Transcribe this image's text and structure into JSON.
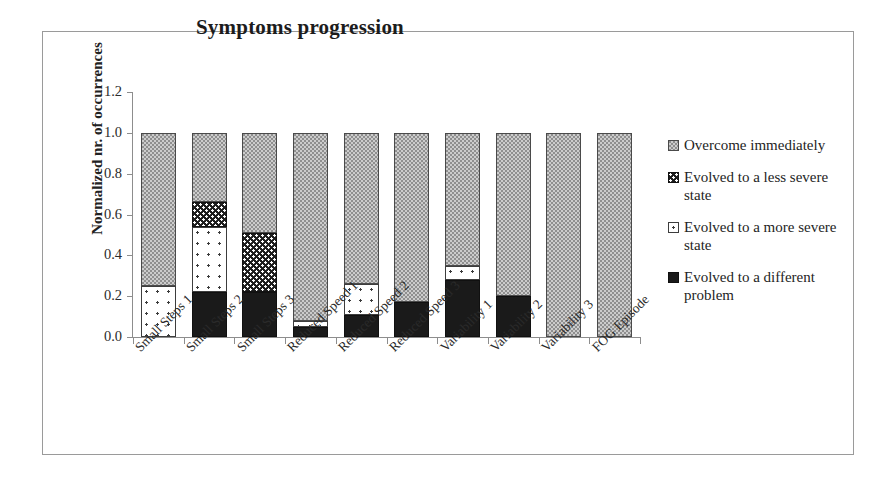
{
  "figure": {
    "title": "Symptoms progression"
  },
  "chart_data": {
    "type": "bar",
    "subtype": "stacked-normalized",
    "title": "Symptoms progression",
    "xlabel": "",
    "ylabel": "Normalized nr. of occurrences",
    "ylim": [
      0.0,
      1.2
    ],
    "yticks": [
      "0.0",
      "0.2",
      "0.4",
      "0.6",
      "0.8",
      "1.0",
      "1.2"
    ],
    "ytick_values": [
      0.0,
      0.2,
      0.4,
      0.6,
      0.8,
      1.0,
      1.2
    ],
    "grid": false,
    "legend_position": "right",
    "categories": [
      "Small Steps 1",
      "Small Steps 2",
      "Small Steps 3",
      "Reduced Speed 1",
      "Reduced Speed 2",
      "Reduced Speed 3",
      "Variability 1",
      "Variability 2",
      "Variability 3",
      "FOG Episode"
    ],
    "series": [
      {
        "name": "Evolved to a different problem",
        "pattern": "solid-black",
        "color": "#1a1a1a",
        "values": [
          0.0,
          0.22,
          0.22,
          0.05,
          0.11,
          0.17,
          0.28,
          0.2,
          0.0,
          0.0
        ]
      },
      {
        "name": "Evolved to a more severe state",
        "pattern": "white-dotted",
        "color": "#ffffff",
        "values": [
          0.25,
          0.32,
          0.0,
          0.03,
          0.15,
          0.0,
          0.07,
          0.0,
          0.0,
          0.0
        ]
      },
      {
        "name": "Evolved to a less severe state",
        "pattern": "dark-dotted",
        "color": "#1d1d1d",
        "values": [
          0.0,
          0.12,
          0.29,
          0.0,
          0.0,
          0.0,
          0.0,
          0.0,
          0.0,
          0.0
        ]
      },
      {
        "name": "Overcome immediately",
        "pattern": "gray-checker",
        "color": "#8f8f8f",
        "values": [
          0.75,
          0.34,
          0.49,
          0.92,
          0.74,
          0.83,
          0.65,
          0.8,
          1.0,
          1.0
        ]
      }
    ]
  },
  "legend": {
    "items": [
      {
        "label": "Overcome immediately",
        "swatch": "gray-checker-swatch"
      },
      {
        "label": "Evolved to a less severe state",
        "swatch": "dark-dotted-swatch"
      },
      {
        "label": "Evolved to a more severe state",
        "swatch": "white-outline-swatch"
      },
      {
        "label": "Evolved to a different problem",
        "swatch": "solid-black-swatch"
      }
    ]
  }
}
